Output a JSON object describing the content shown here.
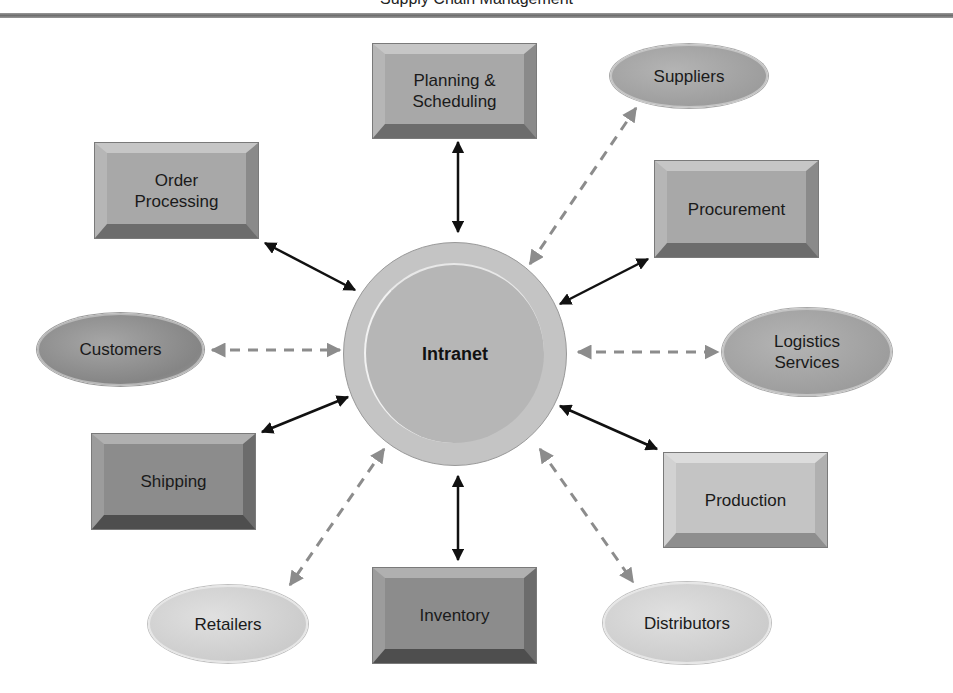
{
  "header": {
    "title": "Supply Chain Management"
  },
  "hub": {
    "label": "Intranet"
  },
  "nodes": {
    "planning": {
      "label": "Planning &\nScheduling",
      "shape": "box",
      "link": "solid"
    },
    "suppliers": {
      "label": "Suppliers",
      "shape": "ellipse",
      "link": "dashed"
    },
    "procurement": {
      "label": "Procurement",
      "shape": "box",
      "link": "solid"
    },
    "logistics": {
      "label": "Logistics\nServices",
      "shape": "ellipse",
      "link": "dashed"
    },
    "production": {
      "label": "Production",
      "shape": "box",
      "link": "solid"
    },
    "distributors": {
      "label": "Distributors",
      "shape": "ellipse",
      "link": "dashed"
    },
    "inventory": {
      "label": "Inventory",
      "shape": "box",
      "link": "solid"
    },
    "retailers": {
      "label": "Retailers",
      "shape": "ellipse",
      "link": "dashed"
    },
    "shipping": {
      "label": "Shipping",
      "shape": "box",
      "link": "solid"
    },
    "customers": {
      "label": "Customers",
      "shape": "ellipse",
      "link": "dashed"
    },
    "order_processing": {
      "label": "Order\nProcessing",
      "shape": "box",
      "link": "solid"
    }
  },
  "legend_semantics": {
    "solid_arrow": "internal department link",
    "dashed_arrow": "external partner link"
  },
  "colors": {
    "solid_arrow": "#111111",
    "dashed_arrow": "#8c8c8c",
    "rule": "#7a7a7a"
  }
}
